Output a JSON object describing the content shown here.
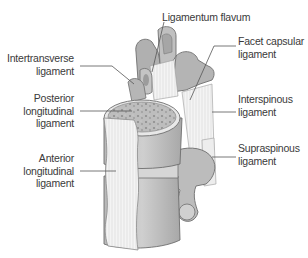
{
  "diagram": {
    "colors": {
      "bone": "#c9c9c9",
      "bone_dark": "#9a9a9a",
      "bone_outline": "#6e6e6e",
      "ligament": "#f2f2f2",
      "cancellous": "#a8a8a8",
      "leader_line": "#555555",
      "label_text": "#3a3a3a",
      "background": "#ffffff"
    },
    "labels": [
      {
        "id": "ligamentum-flavum",
        "lines": [
          "Ligamentum flavum"
        ]
      },
      {
        "id": "intertransverse-ligament",
        "lines": [
          "Intertransverse",
          "ligament"
        ]
      },
      {
        "id": "facet-capsular-ligament",
        "lines": [
          "Facet capsular",
          "ligament"
        ]
      },
      {
        "id": "posterior-longitudinal-ligament",
        "lines": [
          "Posterior",
          "longitudinal",
          "ligament"
        ]
      },
      {
        "id": "interspinous-ligament",
        "lines": [
          "Interspinous",
          "ligament"
        ]
      },
      {
        "id": "supraspinous-ligament",
        "lines": [
          "Supraspinous",
          "ligament"
        ]
      },
      {
        "id": "anterior-longitudinal-ligament",
        "lines": [
          "Anterior",
          "longitudinal",
          "ligament"
        ]
      }
    ]
  }
}
